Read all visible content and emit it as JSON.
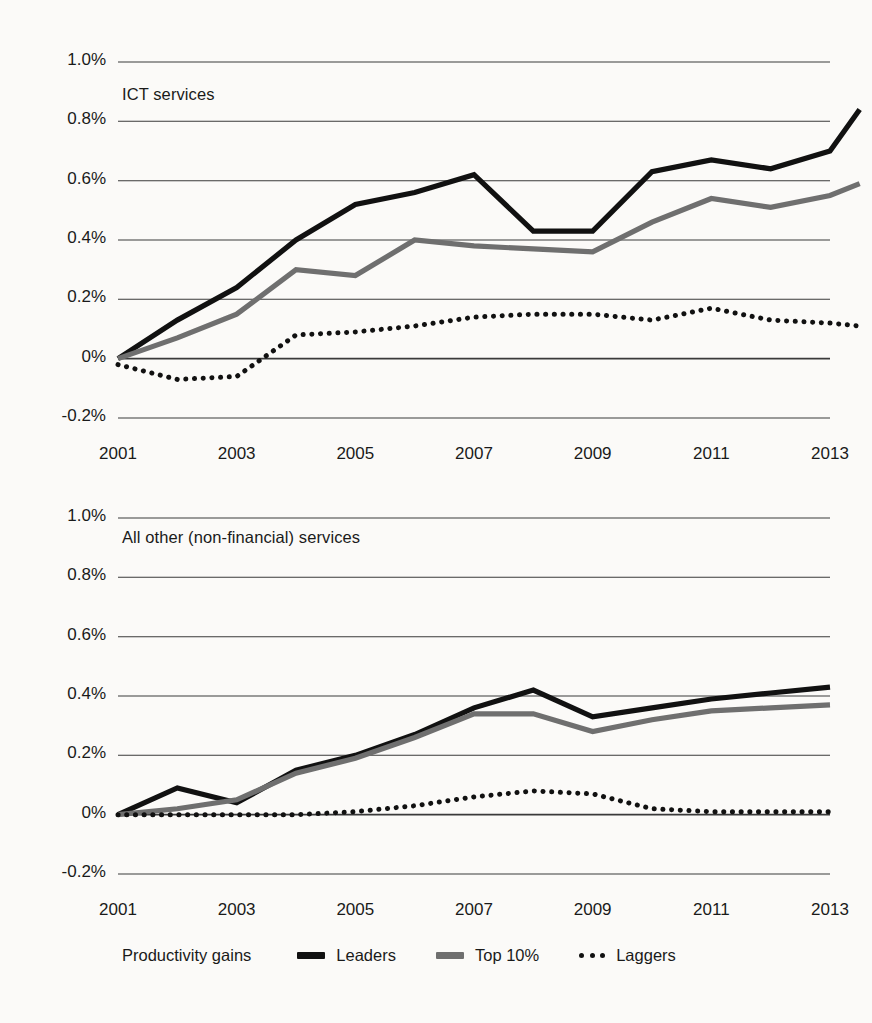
{
  "figure": {
    "background": "#fbfaf8",
    "colors": {
      "leaders": "#111111",
      "top10": "#6f6f6f",
      "laggers": "#111111",
      "gridline": "#3a3a3a",
      "axis": "#111111"
    }
  },
  "legend": {
    "title": "Productivity gains",
    "items": [
      {
        "label": "Leaders",
        "style": "solid-thick-black",
        "swatch": "line-swatch-leaders"
      },
      {
        "label": "Top 10%",
        "style": "solid-gray",
        "swatch": "line-swatch-top10"
      },
      {
        "label": "Laggers",
        "style": "dotted-black",
        "swatch": "line-swatch-laggers"
      }
    ]
  },
  "chart_data": [
    {
      "type": "line",
      "title": "ICT services",
      "xlabel": "",
      "ylabel": "",
      "x": [
        2001,
        2002,
        2003,
        2004,
        2005,
        2006,
        2007,
        2008,
        2009,
        2010,
        2011,
        2012,
        2013
      ],
      "xticks": [
        "2001",
        "2003",
        "2005",
        "2007",
        "2009",
        "2011",
        "2013"
      ],
      "xlim": [
        2001,
        2013
      ],
      "ylim": [
        -0.2,
        1.0
      ],
      "yticks": [
        "1.0%",
        "0.8%",
        "0.6%",
        "0.4%",
        "0.2%",
        "0%",
        "-0.2%"
      ],
      "ytick_values": [
        1.0,
        0.8,
        0.6,
        0.4,
        0.2,
        0.0,
        -0.2
      ],
      "grid": true,
      "legend_position": "below-figure",
      "series": [
        {
          "name": "Leaders",
          "values": [
            0.0,
            0.13,
            0.24,
            0.4,
            0.52,
            0.56,
            0.62,
            0.43,
            0.43,
            0.63,
            0.67,
            0.64,
            0.7,
            0.84
          ]
        },
        {
          "name": "Top 10%",
          "values": [
            0.0,
            0.07,
            0.15,
            0.3,
            0.28,
            0.4,
            0.38,
            0.37,
            0.36,
            0.46,
            0.54,
            0.51,
            0.55,
            0.59
          ]
        },
        {
          "name": "Laggers",
          "values": [
            -0.02,
            -0.07,
            -0.06,
            0.08,
            0.09,
            0.11,
            0.14,
            0.15,
            0.15,
            0.13,
            0.17,
            0.13,
            0.12,
            0.11
          ]
        }
      ],
      "x_dense": [
        2001,
        2002,
        2003,
        2004,
        2005,
        2006,
        2007,
        2008,
        2009,
        2010,
        2011,
        2012,
        2013,
        2013.5
      ]
    },
    {
      "type": "line",
      "title": "All other (non-financial) services",
      "xlabel": "",
      "ylabel": "",
      "x": [
        2001,
        2002,
        2003,
        2004,
        2005,
        2006,
        2007,
        2008,
        2009,
        2010,
        2011,
        2012,
        2013
      ],
      "xticks": [
        "2001",
        "2003",
        "2005",
        "2007",
        "2009",
        "2011",
        "2013"
      ],
      "xlim": [
        2001,
        2013
      ],
      "ylim": [
        -0.2,
        1.0
      ],
      "yticks": [
        "1.0%",
        "0.8%",
        "0.6%",
        "0.4%",
        "0.2%",
        "0%",
        "-0.2%"
      ],
      "ytick_values": [
        1.0,
        0.8,
        0.6,
        0.4,
        0.2,
        0.0,
        -0.2
      ],
      "grid": true,
      "legend_position": "below-figure",
      "series": [
        {
          "name": "Leaders",
          "values": [
            0.0,
            0.09,
            0.04,
            0.15,
            0.2,
            0.27,
            0.36,
            0.42,
            0.33,
            0.36,
            0.39,
            0.41,
            0.43
          ]
        },
        {
          "name": "Top 10%",
          "values": [
            0.0,
            0.02,
            0.05,
            0.14,
            0.19,
            0.26,
            0.34,
            0.34,
            0.28,
            0.32,
            0.35,
            0.36,
            0.37
          ]
        },
        {
          "name": "Laggers",
          "values": [
            0.0,
            0.0,
            0.0,
            0.0,
            0.01,
            0.03,
            0.06,
            0.08,
            0.07,
            0.02,
            0.01,
            0.01,
            0.01
          ]
        }
      ]
    }
  ]
}
